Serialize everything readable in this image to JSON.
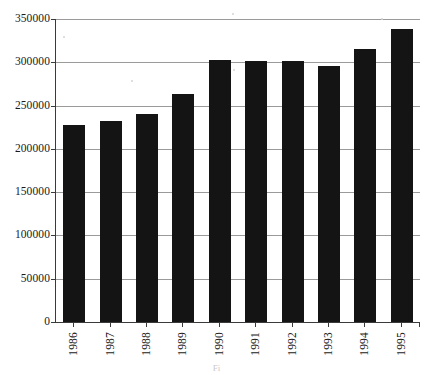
{
  "figure": {
    "caption": "Fi"
  },
  "chart_data": {
    "type": "bar",
    "title": "",
    "subtitle": "",
    "xlabel": "",
    "ylabel": "",
    "categories": [
      "1986",
      "1987",
      "1988",
      "1989",
      "1990",
      "1991",
      "1992",
      "1993",
      "1994",
      "1995"
    ],
    "values": [
      228000,
      232000,
      240000,
      263000,
      303000,
      302000,
      301000,
      296000,
      315000,
      338000
    ],
    "series": [
      {
        "name": "",
        "values": [
          228000,
          232000,
          240000,
          263000,
          303000,
          302000,
          301000,
          296000,
          315000,
          338000
        ]
      }
    ],
    "ylim": [
      0,
      350000
    ],
    "yticks": [
      0,
      50000,
      100000,
      150000,
      200000,
      250000,
      300000,
      350000
    ],
    "ytick_labels": [
      "0",
      "50000",
      "100000",
      "150000",
      "200000",
      "250000",
      "300000",
      "350000"
    ],
    "xtick_labels": [
      "1986",
      "1987",
      "1988",
      "1989",
      "1990",
      "1991",
      "1992",
      "1993",
      "1994",
      "1995"
    ],
    "xtick_label_rotation": 90,
    "grid": true,
    "grid_axis": "y",
    "legend": false,
    "legend_position": "none",
    "bar_color": "#141414",
    "grid_color": "#9a9a9a",
    "axis_color": "#3a3a3a",
    "background_color": "#ffffff"
  }
}
